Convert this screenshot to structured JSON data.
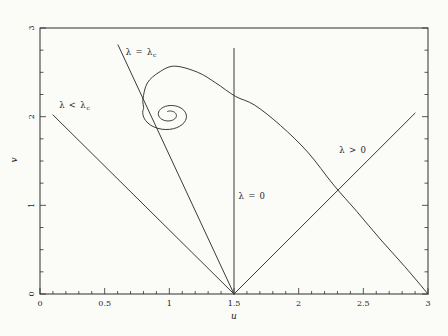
{
  "figure": {
    "background": "#fbfbf8",
    "frame_color": "#2e2e2e",
    "line_color": "#3a3a3a",
    "text_color": "#1c1c1c"
  },
  "chart_data": {
    "type": "line",
    "title": "",
    "xlabel": "u",
    "ylabel": "v",
    "xlim": [
      0,
      3
    ],
    "ylim": [
      0,
      3
    ],
    "x_major_ticks": [
      0,
      0.5,
      1,
      1.5,
      2,
      2.5,
      3
    ],
    "x_tick_labels": [
      "0",
      "0.5",
      "1",
      "1.5",
      "2",
      "2.5",
      "3"
    ],
    "x_minor_step": 0.1,
    "y_major_ticks": [
      0,
      1,
      2,
      3
    ],
    "y_tick_labels": [
      "0",
      "1",
      "2",
      "3"
    ],
    "y_minor_step": 0.25,
    "grid": false,
    "legend": "none",
    "series": [
      {
        "name": "lambda-lt-critical-line",
        "label": {
          "text": "λ < λ",
          "sub": "c"
        },
        "label_pos": [
          0.27,
          2.13
        ],
        "smooth": false,
        "points": [
          [
            0.1,
            2.02
          ],
          [
            1.5,
            0
          ]
        ]
      },
      {
        "name": "lambda-critical-line",
        "label": {
          "text": "λ = λ",
          "sub": "c"
        },
        "label_pos": [
          0.785,
          2.73
        ],
        "smooth": false,
        "points": [
          [
            0.603,
            2.81
          ],
          [
            1.5,
            0
          ]
        ]
      },
      {
        "name": "lambda-zero-vertical-line",
        "label": {
          "text": "λ = 0",
          "sub": ""
        },
        "label_pos": [
          1.64,
          1.1
        ],
        "smooth": false,
        "points": [
          [
            1.5,
            2.77
          ],
          [
            1.5,
            0
          ]
        ]
      },
      {
        "name": "lambda-gt-zero-line",
        "label": {
          "text": "λ > 0",
          "sub": ""
        },
        "label_pos": [
          2.42,
          1.62
        ],
        "smooth": false,
        "points": [
          [
            1.5,
            0
          ],
          [
            2.9,
            2.04
          ]
        ]
      },
      {
        "name": "spiral-trajectory",
        "label": null,
        "smooth": true,
        "points": [
          [
            3.0,
            0.0
          ],
          [
            2.82,
            0.31
          ],
          [
            2.63,
            0.62
          ],
          [
            2.45,
            0.93
          ],
          [
            2.27,
            1.23
          ],
          [
            2.07,
            1.6
          ],
          [
            1.86,
            1.9
          ],
          [
            1.66,
            2.13
          ],
          [
            1.51,
            2.23
          ],
          [
            1.36,
            2.38
          ],
          [
            1.22,
            2.5
          ],
          [
            1.04,
            2.57
          ],
          [
            0.92,
            2.5
          ],
          [
            0.83,
            2.38
          ],
          [
            0.796,
            2.2
          ]
        ],
        "spiral": {
          "cx": 1.0,
          "cy": 2.02,
          "r0": 0.215,
          "theta0": 2.75,
          "theta_span": 11.8,
          "decay": 0.14
        }
      }
    ]
  }
}
